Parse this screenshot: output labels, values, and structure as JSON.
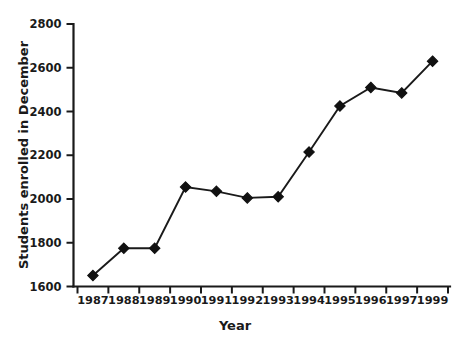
{
  "chart_data": {
    "type": "line",
    "title": "",
    "xlabel": "Year",
    "ylabel": "Students enrolled in December",
    "categories": [
      "1987",
      "1988",
      "1989",
      "1990",
      "1991",
      "1992",
      "1993",
      "1994",
      "1995",
      "1996",
      "1997",
      "1999"
    ],
    "values": [
      1650,
      1775,
      1775,
      2055,
      2035,
      2005,
      2010,
      2215,
      2425,
      2510,
      2485,
      2630
    ],
    "series": [
      {
        "name": "Students enrolled in December",
        "values": [
          1650,
          1775,
          1775,
          2055,
          2035,
          2005,
          2010,
          2215,
          2425,
          2510,
          2485,
          2630
        ]
      }
    ],
    "ylim": [
      1600,
      2800
    ],
    "yticks": [
      1600,
      1800,
      2000,
      2200,
      2400,
      2600,
      2800
    ],
    "ytick_labels": [
      "1600",
      "1800",
      "2000",
      "2200",
      "2400",
      "2600",
      "2800"
    ],
    "xtick_labels": [
      "1987",
      "1988",
      "1989",
      "1990",
      "1991",
      "1992",
      "1993",
      "1994",
      "1995",
      "1996",
      "1997",
      "1999"
    ],
    "grid": false,
    "legend": false,
    "legend_position": "none",
    "marker": "diamond",
    "line_color": "#111111",
    "marker_color": "#111111",
    "background_color": "#ffffff",
    "text_color": "#1a1a1a"
  },
  "axes": {
    "x_title": "Year",
    "y_title": "Students enrolled in December"
  }
}
